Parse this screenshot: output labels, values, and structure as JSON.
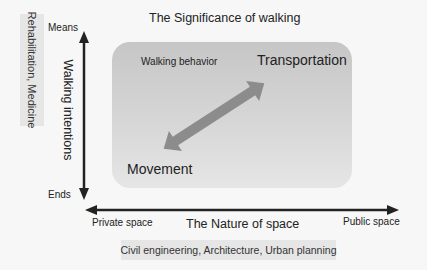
{
  "title": "The Significance of walking",
  "vertical_axis": {
    "label": "Walking intentions",
    "top_end": "Means",
    "bottom_end": "Ends",
    "discipline": "Rehabilitation, Medicine"
  },
  "horizontal_axis": {
    "label": "The Nature of space",
    "left_end": "Private space",
    "right_end": "Public space",
    "discipline": "Civil engineering, Architecture, Urban planning"
  },
  "panel": {
    "label": "Walking behavior",
    "upper_right": "Transportation",
    "lower_left": "Movement"
  },
  "colors": {
    "panel_top": "#c6c6c6",
    "panel_bottom": "#e6e6e6",
    "behavior_arrow": "#8c8c8c",
    "axis": "#222222",
    "label_box": "#e6e6e6"
  }
}
